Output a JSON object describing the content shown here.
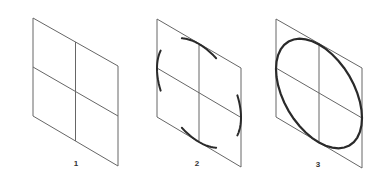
{
  "figure": {
    "colors": {
      "background": "#ffffff",
      "thin_line": "#666666",
      "thick_line": "#2a2a2a"
    },
    "panels": [
      {
        "label": "1",
        "step": "Isometric square divided by center lines",
        "corners": {
          "tl": [
            33,
            18
          ],
          "tr": [
            118,
            66
          ],
          "br": [
            118,
            166
          ],
          "bl": [
            33,
            116
          ]
        },
        "label_pos": [
          76,
          159
        ],
        "show_arcs": false,
        "show_ellipse": false
      },
      {
        "label": "2",
        "step": "Arcs sketched tangent to midpoints of each side",
        "corners": {
          "tl": [
            157,
            19
          ],
          "tr": [
            241,
            68
          ],
          "br": [
            241,
            167
          ],
          "bl": [
            157,
            117
          ]
        },
        "label_pos": [
          197,
          159
        ],
        "show_arcs": true,
        "show_ellipse": false
      },
      {
        "label": "3",
        "step": "Arcs joined into a complete ellipse",
        "corners": {
          "tl": [
            276,
            19
          ],
          "tr": [
            362,
            68
          ],
          "br": [
            362,
            168
          ],
          "bl": [
            276,
            117
          ]
        },
        "label_pos": [
          318,
          160
        ],
        "show_arcs": false,
        "show_ellipse": true
      }
    ]
  }
}
